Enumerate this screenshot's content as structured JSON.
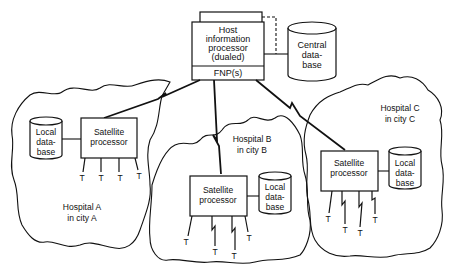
{
  "diagram": {
    "host": {
      "title_lines": [
        "Host",
        "information",
        "processor",
        "(dualed)"
      ],
      "fnp_label": "FNP(s)"
    },
    "central_db": {
      "lines": [
        "Central",
        "data-",
        "base"
      ]
    },
    "hospitals": [
      {
        "name": "Hospital A",
        "city": "in city A",
        "processor_lines": [
          "Satellite",
          "processor"
        ],
        "db_lines": [
          "Local",
          "data-",
          "base"
        ],
        "terminal_label": "T",
        "terminal_count": 4
      },
      {
        "name": "Hospital B",
        "city": "in city B",
        "processor_lines": [
          "Satellite",
          "processor"
        ],
        "db_lines": [
          "Local",
          "data-",
          "base"
        ],
        "terminal_label": "T",
        "terminal_count": 4
      },
      {
        "name": "Hospital C",
        "city": "in city C",
        "processor_lines": [
          "Satellite",
          "processor"
        ],
        "db_lines": [
          "Local",
          "data-",
          "base"
        ],
        "terminal_label": "T",
        "terminal_count": 4
      }
    ]
  }
}
